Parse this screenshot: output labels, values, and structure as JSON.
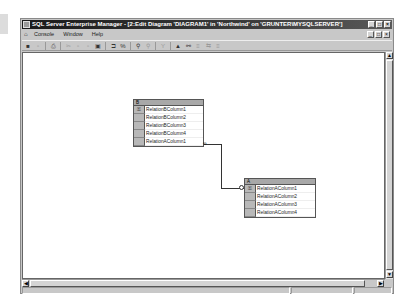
{
  "window": {
    "title": "SQL Server Enterprise Manager - [2:Edit Diagram 'DIAGRAM1' in 'Northwind' on 'GRUNTER\\MYSQLSERVER']",
    "controls": {
      "minimize": "_",
      "maximize": "□",
      "close": "×"
    }
  },
  "menubar": {
    "items": [
      {
        "label": "Console"
      },
      {
        "label": "Window"
      },
      {
        "label": "Help"
      }
    ],
    "mdi_controls": {
      "minimize": "_",
      "restore": "□",
      "close": "×"
    }
  },
  "toolbar": {
    "buttons": [
      {
        "icon": "save-icon",
        "glyph": "■"
      },
      {
        "icon": "new-table-icon",
        "glyph": "▫"
      },
      {
        "icon": "print-icon",
        "glyph": "⎙"
      },
      {
        "icon": "cut-icon",
        "glyph": "✂"
      },
      {
        "icon": "copy-icon",
        "glyph": "▫"
      },
      {
        "icon": "paste-icon",
        "glyph": "▫"
      },
      {
        "icon": "table-properties-icon",
        "glyph": "▣"
      },
      {
        "icon": "add-table-icon",
        "glyph": "⊐"
      },
      {
        "icon": "add-related-tables-icon",
        "glyph": "%"
      },
      {
        "icon": "zoom-icon",
        "glyph": "⚲"
      },
      {
        "icon": "zoom-out-icon",
        "glyph": "⚲"
      },
      {
        "icon": "arrange-tables-icon",
        "glyph": "Y"
      },
      {
        "icon": "show-relationship-labels-icon",
        "glyph": "▲"
      },
      {
        "icon": "new-text-annotation-icon",
        "glyph": "⚯"
      },
      {
        "icon": "manage-indexes-icon",
        "glyph": "≡"
      },
      {
        "icon": "manage-relationships-icon",
        "glyph": "⇆"
      },
      {
        "icon": "manage-constraints-icon",
        "glyph": "≡"
      }
    ]
  },
  "diagram": {
    "tables": [
      {
        "name": "B",
        "columns": [
          {
            "name": "RelationBColumn1",
            "key": true
          },
          {
            "name": "RelationBColumn2",
            "key": false
          },
          {
            "name": "RelationBColumn3",
            "key": false
          },
          {
            "name": "RelationBColumn4",
            "key": false
          },
          {
            "name": "RelationAColumn1",
            "key": false
          }
        ]
      },
      {
        "name": "A",
        "columns": [
          {
            "name": "RelationAColumn1",
            "key": true
          },
          {
            "name": "RelationAColumn2",
            "key": false
          },
          {
            "name": "RelationAColumn3",
            "key": false
          },
          {
            "name": "RelationAColumn4",
            "key": false
          }
        ]
      }
    ],
    "relationship": {
      "from": "B.RelationAColumn1",
      "to": "A.RelationAColumn1",
      "from_end": "∞",
      "to_end": "key"
    }
  },
  "icons": {
    "key": "⚿",
    "scroll_up": "▲",
    "scroll_down": "▼",
    "scroll_left": "◀",
    "scroll_right": "▶"
  }
}
